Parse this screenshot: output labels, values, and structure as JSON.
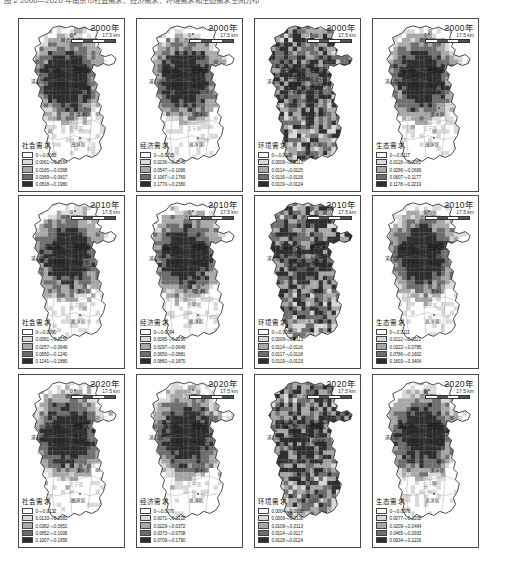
{
  "caption": "图 2  2000—2020 年南京市社会需求、经济需求、环境需求和生态需求空间分布",
  "scale": {
    "start": "0",
    "end": "17.5 km"
  },
  "ramp": [
    "#ffffff",
    "#d9d9d9",
    "#a8a8a8",
    "#6e6e6e",
    "#2e2e2e"
  ],
  "districts": [
    {
      "name": "六合区",
      "x": 47,
      "y": 18,
      "style": "plain",
      "dot": "hollow"
    },
    {
      "name": "南京市",
      "x": 26,
      "y": 47,
      "style": "big",
      "dot": "hollow"
    },
    {
      "name": "栖霞区",
      "x": 55,
      "y": 47,
      "style": "big",
      "dot": "none"
    },
    {
      "name": "浦口区",
      "x": 12,
      "y": 59,
      "style": "plain",
      "dot": "hollow"
    },
    {
      "name": "鼓楼区",
      "x": 33,
      "y": 54,
      "style": "plain",
      "dot": "solid"
    },
    {
      "name": "玄武区",
      "x": 55,
      "y": 57,
      "style": "plain",
      "dot": "hollow"
    },
    {
      "name": "建邺区",
      "x": 33,
      "y": 62,
      "style": "plain",
      "dot": "hollow"
    },
    {
      "name": "秦淮区",
      "x": 56,
      "y": 63,
      "style": "plain",
      "dot": "hollow"
    },
    {
      "name": "雨花台区",
      "x": 32,
      "y": 69,
      "style": "plain",
      "dot": "solid"
    },
    {
      "name": "江宁区",
      "x": 58,
      "y": 69,
      "style": "plain",
      "dot": "hollow"
    },
    {
      "name": "江",
      "x": 22,
      "y": 42,
      "style": "faint",
      "dot": "none"
    },
    {
      "name": "北",
      "x": 18,
      "y": 73,
      "style": "faint",
      "dot": "none"
    },
    {
      "name": "溧水区",
      "x": 57,
      "y": 92,
      "style": "plain",
      "dot": "hollow"
    },
    {
      "name": "江宁区",
      "x": 50,
      "y": 106,
      "style": "faint",
      "dot": "none"
    },
    {
      "name": "高淳区",
      "x": 52,
      "y": 122,
      "style": "plain",
      "dot": "hollow"
    }
  ],
  "chart_data": {
    "type": "map",
    "title": "2000—2020 年南京市社会需求、经济需求、环境需求和生态需求空间分布",
    "region": "南京市",
    "rows": [
      "2000年",
      "2010年",
      "2020年"
    ],
    "columns": [
      "社会需求",
      "经济需求",
      "环境需求",
      "生态需求"
    ],
    "classes": 5,
    "colormap": "grayscale-sequential",
    "panels": [
      {
        "row": 0,
        "col": 0,
        "year": "2000年",
        "indicator": "社会需求",
        "breaks": [
          "0～0.0060",
          "0.0061～0.0164",
          "0.0165～0.0368",
          "0.0369～0.0817",
          "0.0818～0.1980"
        ],
        "min": 0,
        "max": 0.198,
        "fill": "low"
      },
      {
        "row": 0,
        "col": 1,
        "year": "2000年",
        "indicator": "经济需求",
        "breaks": [
          "0～0.0235",
          "0.0236～0.0546",
          "0.0547～0.1066",
          "0.1067～0.1769",
          "0.1770～0.2380"
        ],
        "min": 0,
        "max": 0.238,
        "fill": "low"
      },
      {
        "row": 0,
        "col": 2,
        "year": "2000年",
        "indicator": "环境需求",
        "breaks": [
          "0～0.0008",
          "0.0009～0.0113",
          "0.0114～0.0115",
          "0.0116～0.0118",
          "0.0119～0.0124"
        ],
        "min": 0,
        "max": 0.0124,
        "fill": "high"
      },
      {
        "row": 0,
        "col": 3,
        "year": "2000年",
        "indicator": "生态需求",
        "breaks": [
          "0～0.0117",
          "0.0118～0.0285",
          "0.0286～0.0606",
          "0.0607～0.1177",
          "0.1178～0.2219"
        ],
        "min": 0,
        "max": 0.2219,
        "fill": "low"
      },
      {
        "row": 1,
        "col": 0,
        "year": "2010年",
        "indicator": "社会需求",
        "breaks": [
          "0～0.0080",
          "0.0081～0.0256",
          "0.0257～0.0649",
          "0.0650～0.1240",
          "0.1241～0.1880"
        ],
        "min": 0,
        "max": 0.188,
        "fill": "low"
      },
      {
        "row": 1,
        "col": 1,
        "year": "2010年",
        "indicator": "经济需求",
        "breaks": [
          "0～0.0094",
          "0.0095～0.0296",
          "0.0297～0.0649",
          "0.0650～0.0881",
          "0.0882～0.1870"
        ],
        "min": 0,
        "max": 0.187,
        "fill": "low"
      },
      {
        "row": 1,
        "col": 2,
        "year": "2010年",
        "indicator": "环境需求",
        "breaks": [
          "0～0.0008",
          "0.0009～0.0113",
          "0.0114～0.0116",
          "0.0117～0.0118",
          "0.0119～0.0123"
        ],
        "min": 0,
        "max": 0.0123,
        "fill": "high"
      },
      {
        "row": 1,
        "col": 3,
        "year": "2010年",
        "indicator": "生态需求",
        "breaks": [
          "0～0.0111",
          "0.0112～0.0321",
          "0.0322～0.0785",
          "0.0786～0.1602",
          "0.1603～0.3404"
        ],
        "min": 0,
        "max": 0.3404,
        "fill": "low"
      },
      {
        "row": 2,
        "col": 0,
        "year": "2020年",
        "indicator": "社会需求",
        "breaks": [
          "0～0.0132",
          "0.0133～0.0381",
          "0.0382～0.0651",
          "0.0652～0.1006",
          "0.1007～0.1955"
        ],
        "min": 0,
        "max": 0.1955,
        "fill": "low"
      },
      {
        "row": 2,
        "col": 1,
        "year": "2020年",
        "indicator": "经济需求",
        "breaks": [
          "0～0.0070",
          "0.0071～0.0228",
          "0.0229～0.0372",
          "0.0373～0.0708",
          "0.0709～0.1790"
        ],
        "min": 0,
        "max": 0.179,
        "fill": "low"
      },
      {
        "row": 2,
        "col": 2,
        "year": "2020年",
        "indicator": "环境需求",
        "breaks": [
          "0.0004～0.0008",
          "0.0009～0.0108",
          "0.0109～0.0113",
          "0.0114～0.0117",
          "0.0118～0.0124"
        ],
        "min": 0.0004,
        "max": 0.0124,
        "fill": "high"
      },
      {
        "row": 2,
        "col": 3,
        "year": "2020年",
        "indicator": "生态需求",
        "breaks": [
          "0～0.0076",
          "0.0077～0.0208",
          "0.0209～0.0464",
          "0.0465～0.0933",
          "0.0934～0.2216"
        ],
        "min": 0,
        "max": 0.2216,
        "fill": "low"
      }
    ]
  }
}
